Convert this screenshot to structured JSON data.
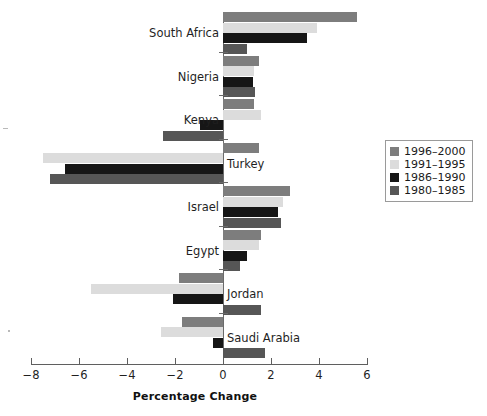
{
  "chart_data": {
    "type": "bar",
    "orientation": "horizontal",
    "title": "",
    "subtitle": "",
    "xlabel": "Percentage Change",
    "ylabel": "",
    "xlim": [
      -8,
      6
    ],
    "xticks": [
      -8,
      -6,
      -4,
      -2,
      0,
      2,
      4,
      6
    ],
    "xticklabels": [
      "−8",
      "−6",
      "−4",
      "−2",
      "0",
      "2",
      "4",
      "6"
    ],
    "grid": false,
    "legend_position": "right",
    "categories": [
      "South Africa",
      "Nigeria",
      "Kenya",
      "Turkey",
      "Israel",
      "Egypt",
      "Jordan",
      "Saudi Arabia"
    ],
    "series": [
      {
        "name": "1996–2000",
        "color": "#7d7d7d",
        "values": [
          5.6,
          1.5,
          1.3,
          1.5,
          2.8,
          1.6,
          -1.85,
          -1.7
        ]
      },
      {
        "name": "1991–1995",
        "color": "#dcdcdc",
        "values": [
          3.9,
          1.3,
          1.6,
          -7.5,
          2.5,
          1.5,
          -5.5,
          -2.6
        ]
      },
      {
        "name": "1986–1990",
        "color": "#161616",
        "values": [
          3.5,
          1.25,
          -0.95,
          -6.6,
          2.3,
          1.0,
          -2.1,
          -0.4
        ]
      },
      {
        "name": "1980–1985",
        "color": "#565656",
        "values": [
          1.0,
          1.35,
          -2.5,
          -7.2,
          2.4,
          0.7,
          1.6,
          1.75
        ]
      }
    ]
  },
  "legend": {
    "entries": [
      {
        "label": "1996–2000",
        "color": "#7d7d7d"
      },
      {
        "label": "1991–1995",
        "color": "#dcdcdc"
      },
      {
        "label": "1986–1990",
        "color": "#161616"
      },
      {
        "label": "1980–1985",
        "color": "#565656"
      }
    ]
  },
  "axis": {
    "x_title": "Percentage Change"
  }
}
